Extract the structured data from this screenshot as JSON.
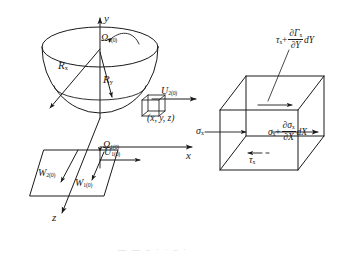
{
  "figure": {
    "type": "technical-line-diagram",
    "background": "#ffffff",
    "ink": "#1a1a1a"
  },
  "left_diagram": {
    "name": "hemisphere-coordinate-system",
    "axes": [
      {
        "id": "y",
        "label": "y",
        "direction": "up"
      },
      {
        "id": "x",
        "label": "x",
        "direction": "right"
      },
      {
        "id": "z",
        "label": "z",
        "direction": "down-left"
      }
    ],
    "labels": {
      "radius_x": {
        "symbol": "R",
        "sub": "x"
      },
      "radius_y": {
        "symbol": "R",
        "sub": "y"
      },
      "omega_upper": {
        "symbol": "Ω",
        "sub": "2(0)"
      },
      "omega_lower": {
        "symbol": "Ω",
        "sub": "1(0)"
      },
      "velocity_u_upper": {
        "symbol": "U",
        "sub": "2(0)"
      },
      "velocity_u_lower": {
        "symbol": "U",
        "sub": "1(0)"
      },
      "velocity_w_upper": {
        "symbol": "W",
        "sub": "2(0)"
      },
      "velocity_w_lower": {
        "symbol": "W",
        "sub": "1(0)"
      },
      "point": "(x, y, z)"
    }
  },
  "right_diagram": {
    "name": "stress-element-cube",
    "labels": {
      "sigma_left": {
        "symbol": "σ",
        "sub": "x"
      },
      "tau_bottom": {
        "symbol": "τ",
        "sub": "x"
      }
    },
    "formulas": {
      "top": {
        "lead_symbol": "τ",
        "lead_sub": "x",
        "plus": "+",
        "numerator": "∂Γ",
        "numerator_sub": "x",
        "denominator": "∂Y",
        "differential": "dY"
      },
      "right": {
        "lead_symbol": "σ",
        "lead_sub": "x",
        "plus": "+",
        "numerator": "∂σ",
        "numerator_sub": "x",
        "denominator": "∂X",
        "differential": "dX"
      }
    }
  },
  "caption": {
    "text": "— —  –  · ·  –  ·"
  }
}
